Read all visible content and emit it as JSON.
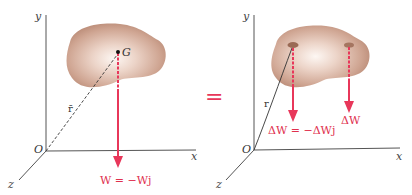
{
  "colors": {
    "force": "#e8375a",
    "axis": "#555555",
    "body_edge": "#b88873",
    "body_mid": "#d9b6a5",
    "body_center": "#fbf3ee",
    "spot": "#9a6a55"
  },
  "left_figure": {
    "axes": {
      "x": "x",
      "y": "y",
      "z": "z",
      "origin": "O"
    },
    "point_label": "G",
    "position_vector_label": "r̄",
    "force_label": "W = −Wj"
  },
  "equals_sign": "=",
  "right_figure": {
    "axes": {
      "x": "x",
      "y": "y",
      "z": "z",
      "origin": "O"
    },
    "position_vector_label": "r",
    "force_label_left": "ΔW = −ΔWj",
    "force_label_right": "ΔW"
  }
}
